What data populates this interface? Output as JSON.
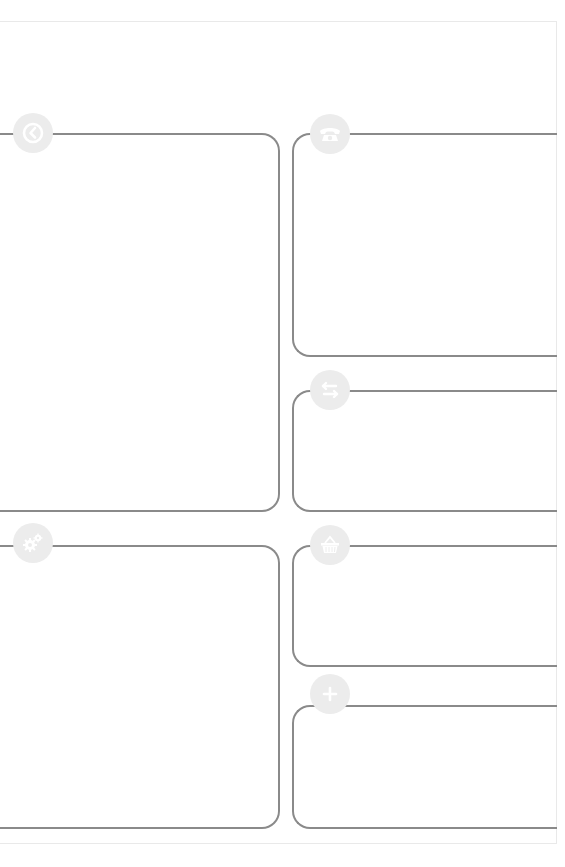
{
  "page": {
    "frame_color": "#e9e9e9",
    "border_color": "#8a8a8a",
    "icon_bg": "#ececec",
    "icon_fg": "#ffffff"
  },
  "panels": [
    {
      "id": "history",
      "icon": "clock-back-icon",
      "column": "left",
      "content": ""
    },
    {
      "id": "settings",
      "icon": "gears-icon",
      "column": "left",
      "content": ""
    },
    {
      "id": "contact",
      "icon": "telephone-icon",
      "column": "right",
      "content": ""
    },
    {
      "id": "transfer",
      "icon": "arrows-exchange-icon",
      "column": "right",
      "content": ""
    },
    {
      "id": "shop",
      "icon": "basket-icon",
      "column": "right",
      "content": ""
    },
    {
      "id": "add",
      "icon": "plus-icon",
      "column": "right",
      "content": ""
    }
  ]
}
